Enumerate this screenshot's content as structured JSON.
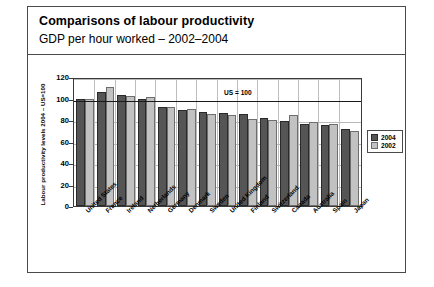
{
  "card": {
    "title": "Comparisons of labour productivity",
    "subtitle": "GDP per hour worked – 2002–2004"
  },
  "chart_data": {
    "type": "bar",
    "title": "Comparisons of labour productivity",
    "subtitle": "GDP per hour worked – 2002–2004",
    "xlabel": "",
    "ylabel": "Labour productivity levels 2004 – US=100",
    "ylim": [
      0,
      120
    ],
    "yticks": [
      0,
      20,
      40,
      60,
      80,
      100,
      120
    ],
    "grid": true,
    "legend_position": "right",
    "annotation": "US = 100",
    "reference_line": 100,
    "categories": [
      "United States",
      "France",
      "Ireland",
      "Netherlands",
      "Germany",
      "Denmark",
      "Sweden",
      "United Kingdom",
      "Finland",
      "Switzerland",
      "Canada",
      "Australia",
      "Spain",
      "Japan"
    ],
    "series": [
      {
        "name": "2004",
        "color": "#555556",
        "values": [
          100,
          106,
          103,
          100,
          92,
          89,
          87.5,
          86.5,
          85.5,
          81.5,
          79.5,
          76,
          75,
          72
        ]
      },
      {
        "name": "2002",
        "color": "#c2c2c2",
        "values": [
          100,
          111,
          102.5,
          101,
          92.5,
          90,
          85.5,
          84.5,
          81,
          80,
          84.5,
          78,
          76,
          70
        ]
      }
    ]
  },
  "legend": {
    "items": [
      {
        "label": "2004",
        "swatch": "#555556"
      },
      {
        "label": "2002",
        "swatch": "#c2c2c2"
      }
    ]
  }
}
